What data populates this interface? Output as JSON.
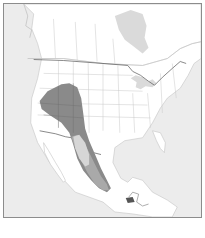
{
  "map": {
    "type": "species-range-map",
    "region": "North America",
    "colors": {
      "ocean": "#ececec",
      "land": "#ffffff",
      "boundary": "#b5b5b5",
      "international_border": "#555555",
      "great_lakes_hudson_bay": "#dadada",
      "range_primary": "#8a8a8a",
      "range_secondary": "#a9a9a9",
      "range_inner_light": "#d6d6d6",
      "range_isolated": "#555555"
    },
    "legend": []
  }
}
